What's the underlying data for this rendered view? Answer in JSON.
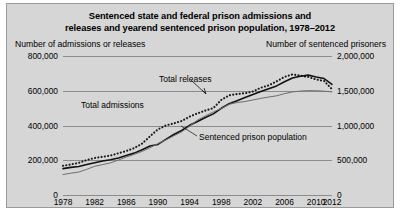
{
  "figure": {
    "title_line1": "Sentenced state and federal prison admissions and",
    "title_line2": "releases and yearend sentenced prison population, 1978–2012",
    "left_axis_header": "Number of admissions or releases",
    "right_axis_header": "Number of sentenced prisoners",
    "background_color": "#d6d6d6",
    "grid_color": "#8c8c8c"
  },
  "chart_data": {
    "type": "line",
    "title": "Sentenced state and federal prison admissions and releases and yearend sentenced prison population, 1978–2012",
    "xlabel": "",
    "ylabel": "Number of admissions or releases",
    "y2label": "Number of sentenced prisoners",
    "xlim": [
      1978,
      2012
    ],
    "ylim": [
      0,
      800000
    ],
    "y2lim": [
      0,
      2000000
    ],
    "grid": true,
    "legend": "inline-labels",
    "yticks": [
      "0",
      "200,000",
      "400,000",
      "600,000",
      "800,000"
    ],
    "ytick_values": [
      0,
      200000,
      400000,
      600000,
      800000
    ],
    "y2ticks": [
      "0",
      "500,000",
      "1,000,000",
      "1,500,000",
      "2,000,000"
    ],
    "y2tick_values": [
      0,
      500000,
      1000000,
      1500000,
      2000000
    ],
    "xticks": [
      "1978",
      "1982",
      "1986",
      "1990",
      "1994",
      "1998",
      "2002",
      "2006",
      "2010",
      "2012"
    ],
    "xtick_values": [
      1978,
      1982,
      1986,
      1990,
      1994,
      1998,
      2002,
      2006,
      2010,
      2012
    ],
    "x": [
      1978,
      1979,
      1980,
      1981,
      1982,
      1983,
      1984,
      1985,
      1986,
      1987,
      1988,
      1989,
      1990,
      1991,
      1992,
      1993,
      1994,
      1995,
      1996,
      1997,
      1998,
      1999,
      2000,
      2001,
      2002,
      2003,
      2004,
      2005,
      2006,
      2007,
      2008,
      2009,
      2010,
      2011,
      2012
    ],
    "series": [
      {
        "name": "Total admissions",
        "label": "Total admissions",
        "axis": "left",
        "style": "dotted",
        "color": "#1a1a1a",
        "values": [
          168000,
          176000,
          185000,
          201000,
          213000,
          220000,
          227000,
          240000,
          253000,
          270000,
          296000,
          338000,
          378000,
          400000,
          412000,
          426000,
          451000,
          470000,
          486000,
          500000,
          547000,
          574000,
          581000,
          586000,
          596000,
          617000,
          631000,
          654000,
          680000,
          694000,
          687000,
          679000,
          665000,
          656000,
          609000
        ]
      },
      {
        "name": "Total releases",
        "label": "Total releases",
        "axis": "left",
        "style": "solid",
        "color": "#111111",
        "values": [
          152000,
          159000,
          164000,
          175000,
          186000,
          196000,
          203000,
          213000,
          227000,
          241000,
          261000,
          282000,
          291000,
          320000,
          348000,
          371000,
          401000,
          423000,
          446000,
          467000,
          499000,
          525000,
          543000,
          561000,
          578000,
          595000,
          611000,
          628000,
          652000,
          673000,
          683000,
          690000,
          679000,
          670000,
          637000
        ]
      },
      {
        "name": "Sentenced prison population",
        "label": "Sentenced prison population",
        "axis": "right",
        "style": "thin-solid",
        "color": "#6e6e6e",
        "values": [
          294000,
          314000,
          330000,
          369000,
          413000,
          437000,
          462000,
          503000,
          546000,
          585000,
          627000,
          680000,
          740000,
          792000,
          851000,
          909000,
          990000,
          1078000,
          1138000,
          1195000,
          1246000,
          1305000,
          1331000,
          1345000,
          1367000,
          1390000,
          1410000,
          1427000,
          1458000,
          1483000,
          1495000,
          1502000,
          1500000,
          1494000,
          1483000
        ]
      }
    ]
  }
}
